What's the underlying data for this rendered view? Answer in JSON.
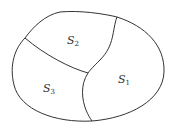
{
  "diagram": {
    "stroke_color": "#333333",
    "background": "#ffffff",
    "regions": [
      {
        "name": "S",
        "subscript": "1",
        "x": 118,
        "y": 74
      },
      {
        "name": "S",
        "subscript": "2",
        "x": 67,
        "y": 35
      },
      {
        "name": "S",
        "subscript": "3",
        "x": 43,
        "y": 83
      }
    ]
  }
}
